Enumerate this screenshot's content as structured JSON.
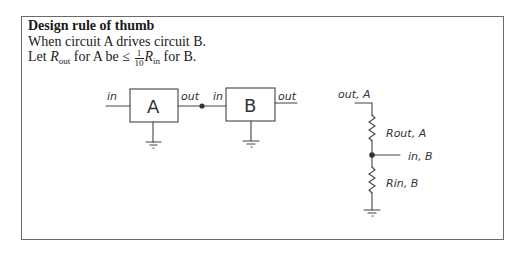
{
  "box": {
    "title": "Design rule of thumb",
    "line1": "When circuit A drives circuit B.",
    "line2": {
      "prefix": "Let ",
      "r_symbol": "R",
      "r_out_sub": "out",
      "mid": " for A be ≤ ",
      "frac_num": "1",
      "frac_den": "10",
      "r_in_sub": "in",
      "suffix": " for B."
    }
  },
  "block_diagram": {
    "block_a": {
      "label": "A",
      "in_label": "in",
      "out_label": "out"
    },
    "block_b": {
      "label": "B",
      "in_label": "in",
      "out_label": "out"
    }
  },
  "divider_circuit": {
    "top_label": "out, A",
    "r1_label": "Rout, A",
    "node_label": "in, B",
    "r2_label": "Rin, B"
  },
  "colors": {
    "ink": "#333333",
    "border": "#6a6a6a",
    "text": "#1a1a1a"
  }
}
